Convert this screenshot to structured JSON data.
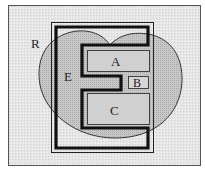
{
  "diagram": {
    "type": "region-diagram",
    "labels": {
      "R": "R",
      "E": "E",
      "A": "A",
      "B": "B",
      "C": "C"
    },
    "colors": {
      "background": "#e9e9e9",
      "region_fill": "#c4c4c4",
      "box_fill": "#d2d2d2",
      "stroke": "#1a1a1a"
    },
    "elements": [
      {
        "id": "R",
        "kind": "heart-shaped region",
        "label": "R"
      },
      {
        "id": "E",
        "kind": "thick E-shaped boundary",
        "label": "E"
      },
      {
        "id": "A",
        "kind": "rectangle",
        "label": "A"
      },
      {
        "id": "B",
        "kind": "small rectangle",
        "label": "B"
      },
      {
        "id": "C",
        "kind": "rectangle",
        "label": "C"
      }
    ]
  }
}
